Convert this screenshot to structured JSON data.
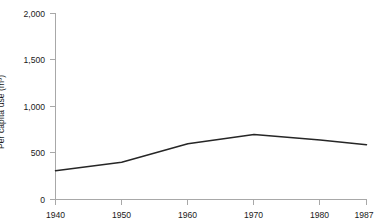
{
  "chart_data": {
    "type": "line",
    "title": "",
    "subtitle": "",
    "xlabel": "",
    "ylabel": "Per capita use (m³)",
    "x": [
      1940,
      1950,
      1960,
      1970,
      1980,
      1987
    ],
    "xtick_labels": [
      "1940",
      "1950",
      "1960",
      "1970",
      "1980",
      "1987"
    ],
    "values": [
      310,
      400,
      600,
      700,
      640,
      590
    ],
    "series": [
      {
        "name": "Per capita use",
        "values": [
          310,
          400,
          600,
          700,
          640,
          590
        ]
      }
    ],
    "ylim": [
      0,
      2000
    ],
    "xlim": [
      1940,
      1987
    ],
    "yticks": [
      0,
      500,
      1000,
      1500,
      2000
    ],
    "ytick_labels": [
      "0",
      "500",
      "1,000",
      "1,500",
      "2,000"
    ],
    "grid": false,
    "legend": false,
    "legend_position": "none",
    "annotations": [],
    "colors": {
      "line": "#262626",
      "axis": "#a8a8a8",
      "text": "#1a1a1a",
      "background": "#ffffff"
    }
  }
}
